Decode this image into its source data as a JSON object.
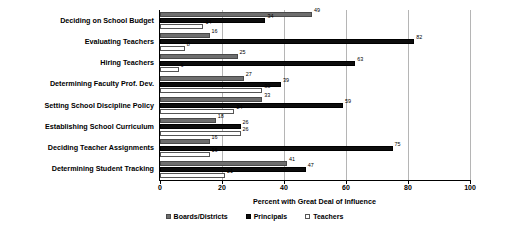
{
  "chart_data": {
    "type": "bar",
    "orientation": "horizontal",
    "title": "",
    "xlabel": "Percent with Great Deal of Influence",
    "ylabel": "",
    "xlim": [
      0,
      100
    ],
    "xticks": [
      "0",
      "20",
      "40",
      "60",
      "80",
      "100"
    ],
    "grid": true,
    "legend_position": "bottom",
    "categories": [
      "Deciding on School Budget",
      "Evaluating Teachers",
      "Hiring Teachers",
      "Determining Faculty Prof. Dev.",
      "Setting School Discipline Policy",
      "Establishing School Curriculum",
      "Deciding Teacher Assignments",
      "Determining Student Tracking"
    ],
    "series": [
      {
        "name": "Boards/Districts",
        "color": "#6e6e6e",
        "values": [
          49,
          16,
          25,
          27,
          33,
          18,
          16,
          41
        ]
      },
      {
        "name": "Principals",
        "color": "#0d0d0d",
        "values": [
          34,
          82,
          63,
          39,
          59,
          26,
          75,
          47
        ]
      },
      {
        "name": "Teachers",
        "color": "#ffffff",
        "values": [
          14,
          8,
          6,
          33,
          24,
          26,
          16,
          21
        ]
      }
    ]
  }
}
